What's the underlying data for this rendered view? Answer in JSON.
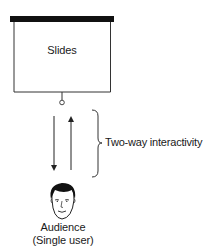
{
  "diagram": {
    "screen": {
      "label": "Slides",
      "bar_color": "#111111",
      "frame_color": "#333333"
    },
    "arrows": {
      "down": "audience-receives",
      "up": "audience-responds"
    },
    "brace": {
      "label": "Two-way interactivity"
    },
    "audience": {
      "icon": "face-icon",
      "label_line1": "Audience",
      "label_line2": "(Single user)"
    }
  }
}
